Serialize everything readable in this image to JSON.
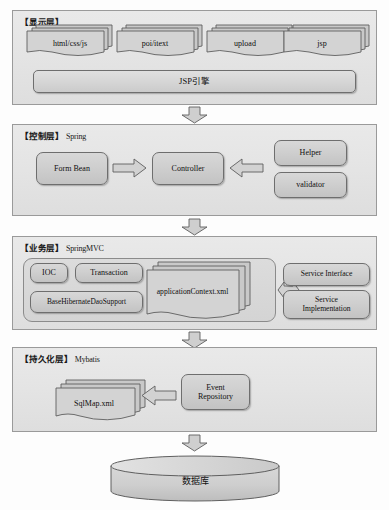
{
  "diagram": {
    "colors": {
      "panel_bg": "#e6e6e6",
      "panel_border": "#9a9a9a",
      "box_bg": "#d0d0d0",
      "box_border": "#6e6e6e",
      "arrow_fill": "#cfcfcf",
      "arrow_stroke": "#5e5e5e",
      "text": "#101010",
      "page_bg": "#ffffff"
    },
    "layers": [
      {
        "id": "presentation",
        "label_cn": "【显示层】",
        "label_tech": "",
        "doc_stacks": [
          {
            "name": "html-css-js",
            "label": "html/css/js"
          },
          {
            "name": "poi-itext",
            "label": "poi/itext"
          },
          {
            "name": "upload",
            "label": "upload"
          },
          {
            "name": "jsp",
            "label": "jsp"
          }
        ],
        "engine_bar": {
          "name": "jsp-engine",
          "label": "JSP引擎"
        }
      },
      {
        "id": "control",
        "label_cn": "【控制层】",
        "label_tech": "Spring",
        "boxes": [
          {
            "name": "form-bean",
            "label": "Form Bean"
          },
          {
            "name": "controller",
            "label": "Controller"
          },
          {
            "name": "helper",
            "label": "Helper"
          },
          {
            "name": "validator",
            "label": "validator"
          }
        ],
        "arrows": [
          {
            "name": "arrow-formbean-to-controller",
            "direction": "right"
          },
          {
            "name": "arrow-helper-to-controller",
            "direction": "left"
          }
        ]
      },
      {
        "id": "business",
        "label_cn": "【业务层】",
        "label_tech": "SpringMVC",
        "boxes": [
          {
            "name": "ioc",
            "label": "IOC"
          },
          {
            "name": "transaction",
            "label": "Transaction"
          },
          {
            "name": "base-hibernate-dao-support",
            "label": "BaseHibernateDaoSupport"
          },
          {
            "name": "service-interface",
            "label": "Service Interface"
          },
          {
            "name": "service-implementation",
            "label": "Service\nImplementation"
          }
        ],
        "doc_stacks": [
          {
            "name": "application-context-xml",
            "label": "applicationContext.xml"
          }
        ],
        "arrows": [
          {
            "name": "arrow-context-to-service",
            "direction": "both"
          }
        ]
      },
      {
        "id": "persistence",
        "label_cn": "【持久化层】",
        "label_tech": "Mybatis",
        "doc_stacks": [
          {
            "name": "sqlmap-xml",
            "label": "SqlMap.xml"
          }
        ],
        "boxes": [
          {
            "name": "event-repository",
            "label": "Event\nRepository"
          }
        ],
        "arrows": [
          {
            "name": "arrow-repository-to-sqlmap",
            "direction": "left"
          }
        ]
      }
    ],
    "flow_arrows": [
      {
        "name": "flow-arrow-presentation-to-control",
        "direction": "down"
      },
      {
        "name": "flow-arrow-control-to-business",
        "direction": "down"
      },
      {
        "name": "flow-arrow-business-to-persistence",
        "direction": "down"
      },
      {
        "name": "flow-arrow-persistence-to-database",
        "direction": "down"
      }
    ],
    "database": {
      "name": "database-cylinder",
      "label": "数据库"
    },
    "labels": {
      "service_impl_line1": "Service",
      "service_impl_line2": "Implementation",
      "event_repo_line1": "Event",
      "event_repo_line2": "Repository"
    }
  }
}
